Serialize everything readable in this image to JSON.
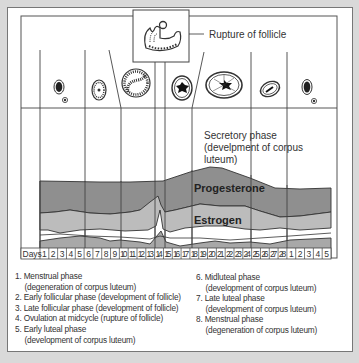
{
  "diagram": {
    "callout_rupture": "Rupture of follicle",
    "secretory_phase": [
      "Secretory phase",
      "(develpment of corpus",
      "luteum)"
    ],
    "band_labels": {
      "progesterone": "Progesterone",
      "estrogen": "Estrogen"
    },
    "days_label": "Days",
    "days": [
      "1",
      "2",
      "3",
      "4",
      "5",
      "6",
      "7",
      "8",
      "9",
      "10",
      "11",
      "12",
      "13",
      "14",
      "15",
      "16",
      "17",
      "18",
      "19",
      "20",
      "21",
      "22",
      "23",
      "24",
      "25",
      "26",
      "27",
      "28",
      "1",
      "2",
      "3",
      "4",
      "5"
    ],
    "colors": {
      "progesterone": "#8f8f8f",
      "estrogen": "#bcbcbc",
      "lower_band": "#a8a8a8",
      "line": "#333333"
    }
  },
  "legend": {
    "left": [
      {
        "label": "1. Menstrual phase",
        "sub": "(degeneration of corpus luteum)"
      },
      {
        "label": "2. Early follicular phase (development of follicle)"
      },
      {
        "label": "3. Late follicular phase (development of follicle)"
      },
      {
        "label": "4. Ovulation at midcycle (rupture of follicle)"
      },
      {
        "label": "5. Early luteal phase",
        "sub": "(development of corpus luteum)"
      }
    ],
    "right": [
      {
        "label": "6. Midluteal phase",
        "sub": "(development of corpus luteum)"
      },
      {
        "label": "7. Late luteal phase",
        "sub": "(development of corpus luteum)"
      },
      {
        "label": "8. Menstrual phase",
        "sub": "(degeneration of corpus luteum)"
      }
    ]
  }
}
